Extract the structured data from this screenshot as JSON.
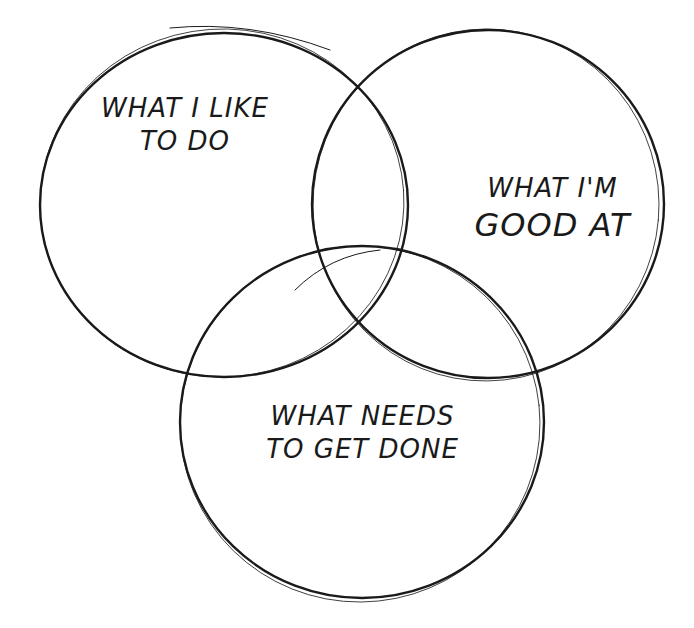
{
  "diagram": {
    "type": "venn",
    "circles": [
      {
        "id": "like",
        "lines": [
          "WHAT I LIKE",
          "TO DO"
        ]
      },
      {
        "id": "good",
        "lines": [
          "WHAT I'M",
          "GOOD AT"
        ]
      },
      {
        "id": "needs",
        "lines": [
          "WHAT NEEDS",
          "TO GET DONE"
        ]
      }
    ],
    "stroke_color": "#1a1a1a",
    "background": "#ffffff"
  }
}
